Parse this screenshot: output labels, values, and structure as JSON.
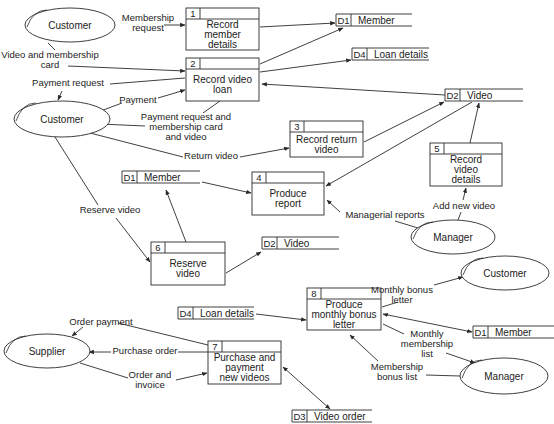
{
  "external_entities": [
    {
      "id": "e1",
      "label": "Customer",
      "cx": 70,
      "cy": 25,
      "rx": 45,
      "ry": 17
    },
    {
      "id": "e2",
      "label": "Customer",
      "cx": 62,
      "cy": 119,
      "rx": 48,
      "ry": 18
    },
    {
      "id": "e3",
      "label": "Manager",
      "cx": 453,
      "cy": 237,
      "rx": 42,
      "ry": 17
    },
    {
      "id": "e4",
      "label": "Customer",
      "cx": 505,
      "cy": 273,
      "rx": 44,
      "ry": 17
    },
    {
      "id": "e5",
      "label": "Supplier",
      "cx": 47,
      "cy": 351,
      "rx": 43,
      "ry": 17
    },
    {
      "id": "e6",
      "label": "Manager",
      "cx": 504,
      "cy": 376,
      "rx": 44,
      "ry": 18
    }
  ],
  "processes": [
    {
      "id": "p1",
      "number": "1",
      "lines": [
        "Record",
        "member",
        "details"
      ],
      "x": 186,
      "y": 8,
      "w": 73,
      "h": 42
    },
    {
      "id": "p2",
      "number": "2",
      "lines": [
        "Record video",
        "loan"
      ],
      "x": 186,
      "y": 58,
      "w": 73,
      "h": 43
    },
    {
      "id": "p3",
      "number": "3",
      "lines": [
        "Record return",
        "video"
      ],
      "x": 290,
      "y": 121,
      "w": 73,
      "h": 36
    },
    {
      "id": "p4",
      "number": "4",
      "lines": [
        "Produce",
        "report"
      ],
      "x": 252,
      "y": 172,
      "w": 72,
      "h": 43
    },
    {
      "id": "p5",
      "number": "5",
      "lines": [
        "Record",
        "video",
        "details"
      ],
      "x": 430,
      "y": 143,
      "w": 72,
      "h": 43
    },
    {
      "id": "p6",
      "number": "6",
      "lines": [
        "Reserve",
        "video"
      ],
      "x": 151,
      "y": 242,
      "w": 74,
      "h": 43
    },
    {
      "id": "p7",
      "number": "7",
      "lines": [
        "Purchase and",
        "payment",
        "new videos"
      ],
      "x": 208,
      "y": 341,
      "w": 73,
      "h": 43
    },
    {
      "id": "p8",
      "number": "8",
      "lines": [
        "Produce",
        "monthly bonus",
        "letter"
      ],
      "x": 307,
      "y": 288,
      "w": 74,
      "h": 42
    }
  ],
  "data_stores": [
    {
      "id": "s1",
      "code": "D1",
      "label": "Member",
      "x": 336,
      "y": 14,
      "w": 76
    },
    {
      "id": "s2",
      "code": "D4",
      "label": "Loan details",
      "x": 352,
      "y": 48,
      "w": 77
    },
    {
      "id": "s3",
      "code": "D2",
      "label": "Video",
      "x": 445,
      "y": 89,
      "w": 78
    },
    {
      "id": "s4",
      "code": "D1",
      "label": "Member",
      "x": 122,
      "y": 171,
      "w": 78
    },
    {
      "id": "s5",
      "code": "D2",
      "label": "Video",
      "x": 262,
      "y": 237,
      "w": 77
    },
    {
      "id": "s6",
      "code": "D4",
      "label": "Loan details",
      "x": 178,
      "y": 307,
      "w": 76
    },
    {
      "id": "s7",
      "code": "D1",
      "label": "Member",
      "x": 473,
      "y": 326,
      "w": 81
    },
    {
      "id": "s8",
      "code": "D3",
      "label": "Video order",
      "x": 292,
      "y": 410,
      "w": 80
    }
  ],
  "flow_labels": [
    {
      "lines": [
        "Membership",
        "request"
      ],
      "x": 148,
      "y": 21
    },
    {
      "lines": [
        "Video and membership",
        "card"
      ],
      "x": 50,
      "y": 58
    },
    {
      "lines": [
        "Payment request"
      ],
      "x": 68,
      "y": 86
    },
    {
      "lines": [
        "Payment"
      ],
      "x": 138,
      "y": 103
    },
    {
      "lines": [
        "Payment request and",
        "membership card",
        "and video"
      ],
      "x": 186,
      "y": 120
    },
    {
      "lines": [
        "Return video"
      ],
      "x": 211,
      "y": 159
    },
    {
      "lines": [
        "Reserve video"
      ],
      "x": 110,
      "y": 213
    },
    {
      "lines": [
        "Managerial reports"
      ],
      "x": 385,
      "y": 218
    },
    {
      "lines": [
        "Add new video"
      ],
      "x": 464,
      "y": 209
    },
    {
      "lines": [
        "Monthly bonus",
        "letter"
      ],
      "x": 402,
      "y": 293
    },
    {
      "lines": [
        "Monthly",
        "membership",
        "list"
      ],
      "x": 427,
      "y": 337
    },
    {
      "lines": [
        "Membership",
        "bonus list"
      ],
      "x": 397,
      "y": 370
    },
    {
      "lines": [
        "Order payment"
      ],
      "x": 101,
      "y": 325
    },
    {
      "lines": [
        "Purchase order"
      ],
      "x": 145,
      "y": 354
    },
    {
      "lines": [
        "Order and",
        "invoice"
      ],
      "x": 150,
      "y:": 0,
      "y2": 378
    }
  ],
  "colors": {
    "stroke": "#2a2a2a",
    "text": "#222222",
    "background": "#ffffff"
  }
}
